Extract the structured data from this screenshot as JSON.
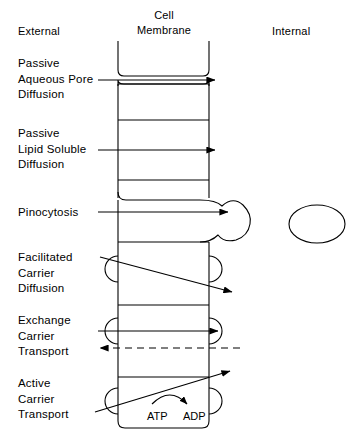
{
  "diagram": {
    "headers": {
      "external": "External",
      "membrane_line1": "Cell",
      "membrane_line2": "Membrane",
      "internal": "Internal"
    },
    "mechanisms": [
      {
        "id": "passive-aqueous-pore-diffusion",
        "lines": [
          "Passive",
          "Aqueous Pore",
          "Diffusion"
        ],
        "arrow": "solid-right"
      },
      {
        "id": "passive-lipid-soluble-diffusion",
        "lines": [
          "Passive",
          "Lipid Soluble",
          "Diffusion"
        ],
        "arrow": "solid-right"
      },
      {
        "id": "pinocytosis",
        "lines": [
          "Pinocytosis"
        ],
        "arrow": "solid-right"
      },
      {
        "id": "facilitated-carrier-diffusion",
        "lines": [
          "Facilitated",
          "Carrier",
          "Diffusion"
        ],
        "arrow": "diagonal-down-right"
      },
      {
        "id": "exchange-carrier-transport",
        "lines": [
          "Exchange",
          "Carrier",
          "Transport"
        ],
        "arrow": "solid-right-and-dashed-left"
      },
      {
        "id": "active-carrier-transport",
        "lines": [
          "Active",
          "Carrier",
          "Transport"
        ],
        "arrow": "diagonal-up-right"
      }
    ],
    "energy": {
      "substrate": "ATP",
      "product": "ADP"
    },
    "colors": {
      "stroke": "#000000",
      "background": "#ffffff",
      "text": "#000000"
    }
  }
}
